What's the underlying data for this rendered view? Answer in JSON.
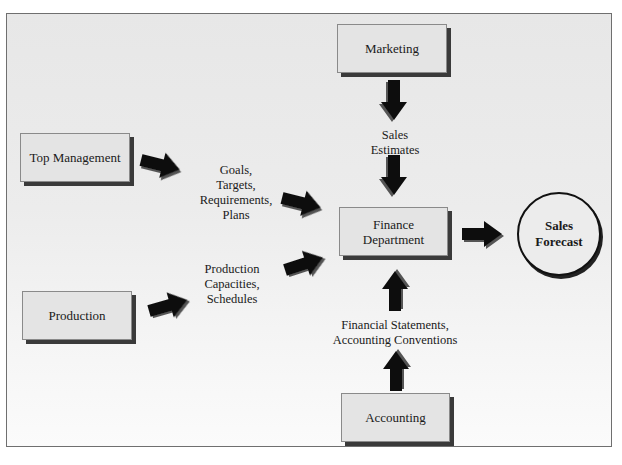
{
  "diagram": {
    "nodes": {
      "top_management": "Top Management",
      "marketing": "Marketing",
      "finance": [
        "Finance",
        "Department"
      ],
      "production": "Production",
      "accounting": "Accounting",
      "sales_forecast": [
        "Sales",
        "Forecast"
      ]
    },
    "flow_labels": {
      "top_management": [
        "Goals,",
        "Targets,",
        "Requirements,",
        "Plans"
      ],
      "marketing": [
        "Sales",
        "Estimates"
      ],
      "production": [
        "Production",
        "Capacities,",
        "Schedules"
      ],
      "accounting": [
        "Financial Statements,",
        "Accounting Conventions"
      ]
    },
    "colors": {
      "box_fill": "#e4e4e4",
      "box_shadow": "#3a3a3a",
      "arrow": "#111111",
      "background": "#ececec"
    }
  }
}
